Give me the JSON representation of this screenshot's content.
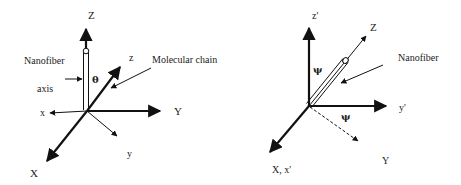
{
  "left_diagram": {
    "labels": {
      "Z": "Z",
      "z": "z",
      "x": "x",
      "X": "X",
      "Y": "Y",
      "y": "y",
      "theta": "θ",
      "nanofiber": "Nanofiber",
      "axis": "axis",
      "molecular_chain": "Molecular chain"
    }
  },
  "right_diagram": {
    "labels": {
      "z_prime": "z'",
      "Z": "Z",
      "nanofiber": "Nanofiber",
      "y_prime": "y'",
      "psi_vertical": "ψ",
      "psi_horizontal": "ψ",
      "X_x_prime": "X, x'",
      "Y": "Y"
    }
  },
  "colors": {
    "stroke": "#111111",
    "background": "#ffffff"
  }
}
